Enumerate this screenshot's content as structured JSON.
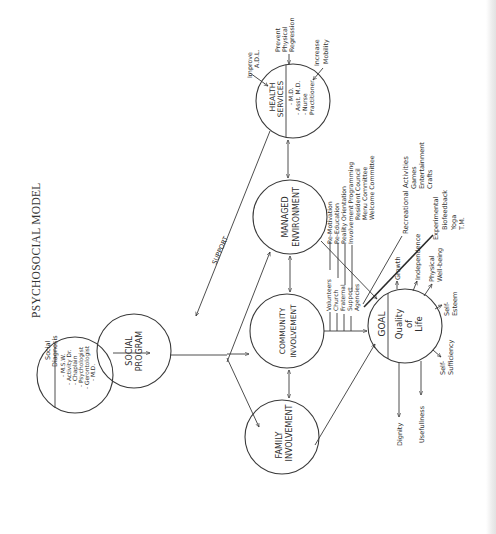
{
  "title": "PSYCHOSOCIAL MODEL",
  "nodes": {
    "social_diagnosis": {
      "label": "Social Diagnosis",
      "label_lines": [
        "Social",
        "Diagnosis"
      ],
      "members": [
        "- M.S.W.",
        "- Activity Dr.",
        "- Chaplain",
        "- Psychologist",
        "- Gerontologist",
        "- M.D."
      ]
    },
    "social_program": {
      "label_lines": [
        "SOCIAL",
        "PROGRAM"
      ]
    },
    "health_services": {
      "label_lines": [
        "HEALTH",
        "SERVICES"
      ],
      "members": [
        "- M.D.",
        "- Asst. M.D.",
        "- Nurse",
        "Practitioner"
      ]
    },
    "managed_environment": {
      "label_lines": [
        "MANAGED",
        "ENVIRONMENT"
      ]
    },
    "community_involvement": {
      "label_lines": [
        "COMMUNITY",
        "INVOLVEMENT"
      ]
    },
    "family_involvement": {
      "label_lines": [
        "FAMILY",
        "INVOLVEMENT"
      ]
    },
    "goal": {
      "label": "GOAL",
      "sub_lines": [
        "Quality",
        "of",
        "Life"
      ]
    }
  },
  "edges": {
    "support_label": "SUPPORT"
  },
  "health_services_outcomes": [
    {
      "lines": [
        "Improve",
        "A.D.L."
      ]
    },
    {
      "lines": [
        "Prevent",
        "Physical",
        "Regression"
      ]
    },
    {
      "lines": [
        "Increase",
        "Mobility"
      ]
    }
  ],
  "managed_environment_items": [
    "Re-Motivation",
    "Re-Education",
    "Reality Orientation",
    "Involvement Programming",
    "Resident Council",
    "Menu Committee",
    "Welcome Committee"
  ],
  "community_involvement_items": [
    "Volunteers",
    "Church",
    "Fraternal",
    "Support",
    "Agencies"
  ],
  "recreational": {
    "heading": "Recreational Activities",
    "items": [
      "Games",
      "Entertainment",
      "Crafts"
    ]
  },
  "experimental": {
    "heading": "Experimental",
    "items": [
      "Biofeedback",
      "Yoga",
      "T.M."
    ]
  },
  "goal_outcomes": {
    "growth": "Growth",
    "independence": "Independence",
    "physical_wellbeing": [
      "Physical",
      "Well-being"
    ],
    "self_esteem": [
      "Self-",
      "Esteem"
    ],
    "self_sufficiency": [
      "Self-",
      "Sufficiency"
    ],
    "usefulness": "Usefullness",
    "dignity": "Dignity"
  },
  "colors": {
    "ink": "#2e2e2e",
    "paper": "#ffffff"
  }
}
